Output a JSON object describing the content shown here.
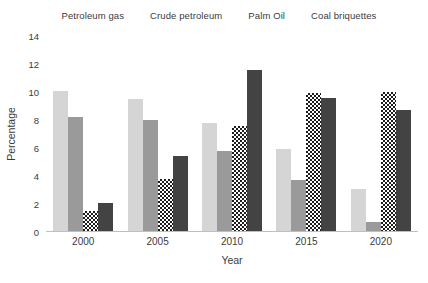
{
  "chart_data": {
    "type": "bar",
    "title": "",
    "xlabel": "Year",
    "ylabel": "Percentage",
    "categories": [
      "2000",
      "2005",
      "2010",
      "2015",
      "2020"
    ],
    "ylim": [
      0,
      14
    ],
    "yticks": [
      0,
      2,
      4,
      6,
      8,
      10,
      12,
      14
    ],
    "ytick_labels": [
      "0",
      "2",
      "4",
      "6",
      "8",
      "10",
      "12",
      "14"
    ],
    "grid": false,
    "legend_position": "top-center",
    "series": [
      {
        "name": "Petroleum gas",
        "color": "#d5d5d5",
        "pattern": "solid",
        "values": [
          10.1,
          9.5,
          7.8,
          5.9,
          3.1
        ]
      },
      {
        "name": "Crude petroleum",
        "color": "#9a9a9a",
        "pattern": "solid",
        "values": [
          8.2,
          8.0,
          5.8,
          3.7,
          0.7
        ]
      },
      {
        "name": "Palm Oil",
        "color": "#1c1c1c",
        "pattern": "checkerboard",
        "values": [
          1.5,
          3.8,
          7.6,
          9.9,
          10.0
        ]
      },
      {
        "name": "Coal briquettes",
        "color": "#434343",
        "pattern": "solid",
        "values": [
          2.1,
          5.4,
          11.6,
          9.6,
          8.7
        ]
      }
    ]
  },
  "legend": {
    "items": [
      {
        "label": "Petroleum gas",
        "swatch": "legend-swatch-petroleum-gas"
      },
      {
        "label": "Crude petroleum",
        "swatch": "legend-swatch-crude-petroleum"
      },
      {
        "label": "Palm Oil",
        "swatch": "legend-swatch-palm-oil"
      },
      {
        "label": "Coal briquettes",
        "swatch": "legend-swatch-coal-briquettes"
      }
    ]
  }
}
